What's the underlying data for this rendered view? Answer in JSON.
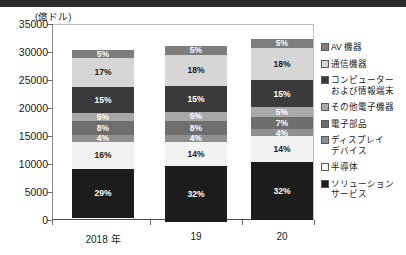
{
  "chart_data": {
    "type": "bar",
    "subtype": "stacked-bar",
    "title": "",
    "unit_label": "(億ドル)",
    "xlabel": "",
    "ylabel": "",
    "ylim": [
      0,
      35000
    ],
    "ytick_labels": [
      "0",
      "5000",
      "10000",
      "15000",
      "20000",
      "25000",
      "30000",
      "35000"
    ],
    "ytick_values": [
      0,
      5000,
      10000,
      15000,
      20000,
      25000,
      30000,
      35000
    ],
    "grid": false,
    "legend_position": "right",
    "categories": [
      "2018 年",
      "19",
      "20"
    ],
    "bar_totals": [
      30400,
      31000,
      32400
    ],
    "stack_order_bottom_to_top": [
      "ソリューション\nサービス",
      "半導体",
      "ディスプレイ\nデバイス",
      "電子部品",
      "その他電子機器",
      "コンピューター\nおよび情報端末",
      "通信機器",
      "AV 機器"
    ],
    "series": [
      {
        "name": "ソリューション\nサービス",
        "color": "#1c1c1c",
        "text_color": "#ffffff",
        "values": [
          29,
          32,
          32
        ],
        "labels": [
          "29%",
          "32%",
          "32%"
        ]
      },
      {
        "name": "半導体",
        "color": "#f2f2f2",
        "text_color": "#1a1a1a",
        "values": [
          16,
          14,
          14
        ],
        "labels": [
          "16%",
          "14%",
          "14%"
        ]
      },
      {
        "name": "ディスプレイ\nデバイス",
        "color": "#8f8f8f",
        "text_color": "#ffffff",
        "values": [
          4,
          4,
          4
        ],
        "labels": [
          "4%",
          "4%",
          "4%"
        ]
      },
      {
        "name": "電子部品",
        "color": "#6e6e6e",
        "text_color": "#ffffff",
        "values": [
          8,
          8,
          7
        ],
        "labels": [
          "8%",
          "8%",
          "7%"
        ]
      },
      {
        "name": "その他電子機器",
        "color": "#a8a8a8",
        "text_color": "#ffffff",
        "values": [
          5,
          5,
          5
        ],
        "labels": [
          "5%",
          "5%",
          "5%"
        ]
      },
      {
        "name": "コンピューター\nおよび情報端末",
        "color": "#3a3a3a",
        "text_color": "#ffffff",
        "values": [
          15,
          15,
          15
        ],
        "labels": [
          "15%",
          "15%",
          "15%"
        ]
      },
      {
        "name": "通信機器",
        "color": "#d6d6d6",
        "text_color": "#1a1a1a",
        "values": [
          17,
          18,
          18
        ],
        "labels": [
          "17%",
          "18%",
          "18%"
        ]
      },
      {
        "name": "AV 機器",
        "color": "#7d7d7d",
        "text_color": "#ffffff",
        "values": [
          5,
          5,
          5
        ],
        "labels": [
          "5%",
          "5%",
          "5%"
        ]
      }
    ]
  },
  "legend": {
    "items": [
      {
        "label": "AV 機器",
        "color": "#7d7d7d"
      },
      {
        "label": "通信機器",
        "color": "#d6d6d6"
      },
      {
        "label": "コンピューター\nおよび情報端末",
        "color": "#3a3a3a"
      },
      {
        "label": "その他電子機器",
        "color": "#a8a8a8"
      },
      {
        "label": "電子部品",
        "color": "#6e6e6e"
      },
      {
        "label": "ディスプレイ\nデバイス",
        "color": "#8f8f8f"
      },
      {
        "label": "半導体",
        "color": "#fbfbfb"
      },
      {
        "label": "ソリューション\nサービス",
        "color": "#1c1c1c"
      }
    ]
  }
}
